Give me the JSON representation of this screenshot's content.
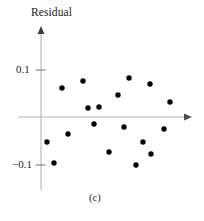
{
  "figure": {
    "caption": "(c)",
    "axis_label_y": "Residual",
    "axis_label_x": "",
    "axis_color": "#b4b4b4",
    "point_color": "#000000",
    "text_color": "#1a1a1a",
    "background": "#ffffff"
  },
  "chart_data": {
    "type": "scatter",
    "title": "",
    "xlabel": "",
    "ylabel": "Residual",
    "ylim": [
      -0.14,
      0.19
    ],
    "xlim": [
      0,
      1
    ],
    "grid": false,
    "legend": null,
    "y_ticks": [
      0.1,
      -0.1
    ],
    "y_tick_labels": [
      "0.1",
      "−0.1"
    ],
    "x_ticks": [],
    "x_tick_labels": [],
    "annotations": [
      "(c)"
    ],
    "series": [
      {
        "name": "residuals",
        "marker": "circle",
        "color": "#000000",
        "points": [
          {
            "px": 62,
            "py": 88,
            "y": 0.062
          },
          {
            "px": 83,
            "py": 81,
            "y": 0.077
          },
          {
            "px": 129,
            "py": 78,
            "y": 0.083
          },
          {
            "px": 150,
            "py": 84,
            "y": 0.07
          },
          {
            "px": 118,
            "py": 95,
            "y": 0.047
          },
          {
            "px": 170,
            "py": 102,
            "y": 0.032
          },
          {
            "px": 88,
            "py": 108,
            "y": 0.019
          },
          {
            "px": 99,
            "py": 107,
            "y": 0.021
          },
          {
            "px": 94,
            "py": 124,
            "y": -0.015
          },
          {
            "px": 124,
            "py": 127,
            "y": -0.021
          },
          {
            "px": 164,
            "py": 129,
            "y": -0.026
          },
          {
            "px": 68,
            "py": 134,
            "y": -0.036
          },
          {
            "px": 143,
            "py": 142,
            "y": -0.053
          },
          {
            "px": 47,
            "py": 142,
            "y": -0.053
          },
          {
            "px": 109,
            "py": 152,
            "y": -0.074
          },
          {
            "px": 151,
            "py": 154,
            "y": -0.079
          },
          {
            "px": 54,
            "py": 163,
            "y": -0.098
          },
          {
            "px": 136,
            "py": 165,
            "y": -0.102
          }
        ]
      }
    ]
  },
  "axes_geometry": {
    "origin_x": 41,
    "origin_y": 117,
    "y_axis_top": 26,
    "y_axis_bottom": 190,
    "x_axis_left": 18,
    "x_axis_right": 192,
    "tick_pos_y": 70,
    "tick_neg_y": 165
  }
}
